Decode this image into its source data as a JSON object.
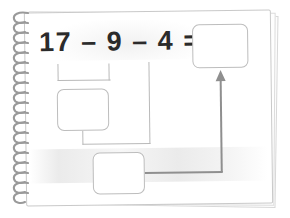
{
  "worksheet": {
    "title": "Subtraction worksheet on spiral notepad",
    "medium": "spiral-bound notepad page",
    "equation": {
      "text": "17 – 9 – 4 =",
      "operands": [
        17,
        9,
        4
      ],
      "operators": [
        "–",
        "–"
      ],
      "result_placeholder": ""
    },
    "answer_boxes": [
      {
        "id": "top-right",
        "name": "final-answer-box",
        "value": "",
        "empty": true
      },
      {
        "id": "middle",
        "name": "first-step-answer-box",
        "value": "",
        "empty": true
      },
      {
        "id": "bottom",
        "name": "second-step-answer-box",
        "value": "",
        "empty": true
      }
    ],
    "connectors": [
      {
        "name": "bracket-17-minus-9",
        "from": "17 – 9",
        "to": "first-step-answer-box"
      },
      {
        "name": "step-one-to-step-two",
        "from": "first-step-answer-box",
        "to": "second-step-answer-box"
      },
      {
        "name": "operand-4-to-step-two",
        "from": "4",
        "to": "second-step-answer-box"
      },
      {
        "name": "step-two-to-final-arrow",
        "from": "second-step-answer-box",
        "to": "final-answer-box",
        "arrow": true
      }
    ],
    "colors": {
      "page": "#ffffff",
      "page_border": "#c9c9c9",
      "text": "#2b2b2b",
      "box_border": "#bdbdbd",
      "line": "#b9b9b9",
      "arrow": "#8f8f8f",
      "spiral": "#9a9a9a"
    },
    "spiral": {
      "coil_count": 19
    }
  }
}
